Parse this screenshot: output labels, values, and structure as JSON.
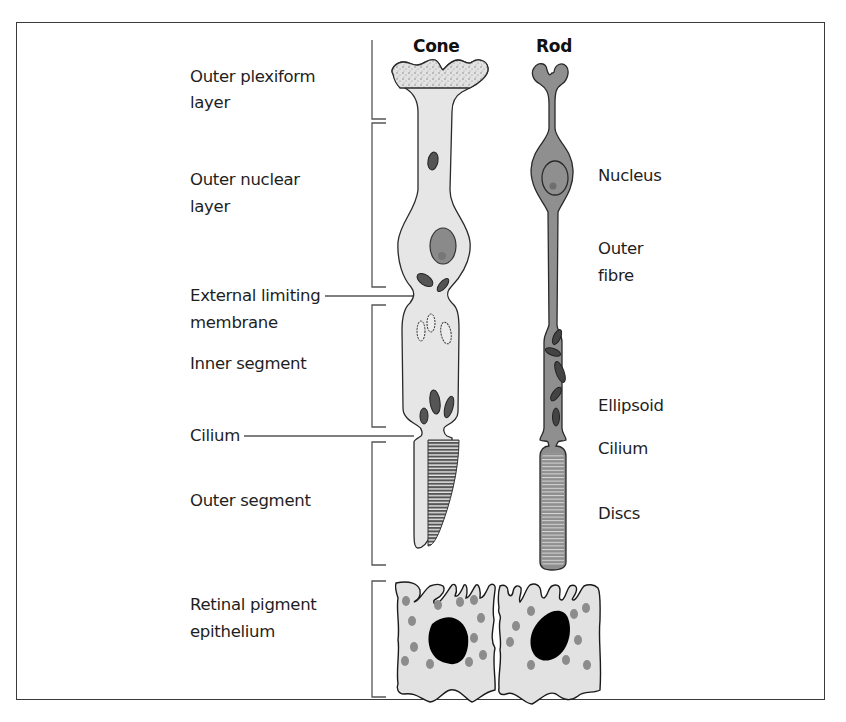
{
  "figure": {
    "type": "diagram",
    "headers": {
      "cone": "Cone",
      "rod": "Rod"
    },
    "left_labels": {
      "outer_plexiform_1": "Outer plexiform",
      "outer_plexiform_2": "layer",
      "outer_nuclear_1": "Outer nuclear",
      "outer_nuclear_2": "layer",
      "elm_1": "External limiting",
      "elm_2": "membrane",
      "inner_segment": "Inner segment",
      "cilium": "Cilium",
      "outer_segment": "Outer segment",
      "rpe_1": "Retinal pigment",
      "rpe_2": "epithelium"
    },
    "right_labels": {
      "nucleus": "Nucleus",
      "outer_fibre_1": "Outer",
      "outer_fibre_2": "fibre",
      "ellipsoid": "Ellipsoid",
      "cilium": "Cilium",
      "discs": "Discs"
    },
    "colors": {
      "border": "#3a3a3a",
      "cone_fill": "#e6e6e6",
      "rod_fill": "#8f8f8f",
      "nucleus_fill": "#8a8a8a",
      "outline": "#2a2a2a",
      "rpe_fill": "#e2e2e2",
      "rpe_melanin": "#8c8c8c",
      "rpe_nucleus": "#000000",
      "bracket": "#555555"
    }
  }
}
